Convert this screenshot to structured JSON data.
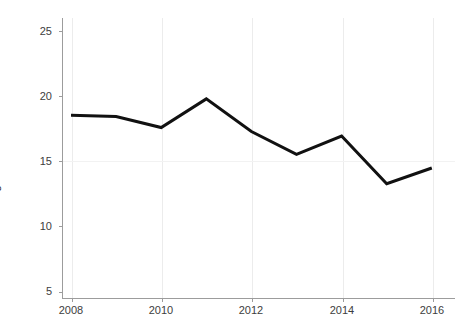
{
  "chart_data": {
    "type": "line",
    "title": "",
    "subtitle": "",
    "xlabel": "",
    "ylabel": "Framing Runs/7000 PA",
    "x": [
      2008,
      2009,
      2010,
      2011,
      2012,
      2013,
      2014,
      2015,
      2016
    ],
    "series": [
      {
        "name": "Framing Runs/7000 PA",
        "values": [
          18.55,
          18.45,
          17.6,
          19.8,
          17.3,
          15.55,
          16.95,
          13.3,
          14.5
        ],
        "color": "#111111",
        "line_width": 3
      }
    ],
    "xlim": [
      2007.8,
      2016.5
    ],
    "ylim": [
      5,
      26
    ],
    "xticks": [
      2008,
      2010,
      2012,
      2014,
      2016
    ],
    "xtick_labels": [
      "2008",
      "2010",
      "2012",
      "2014",
      "2016"
    ],
    "yticks": [
      5,
      10,
      15,
      20,
      25
    ],
    "ytick_labels": [
      "5",
      "10",
      "15",
      "20",
      "25"
    ],
    "grid": "light-vertical-and-one-horizontal",
    "legend": "none",
    "background": "#ffffff",
    "axis_color": "#9c9c9c",
    "tick_label_color": "#3d3d3d"
  }
}
